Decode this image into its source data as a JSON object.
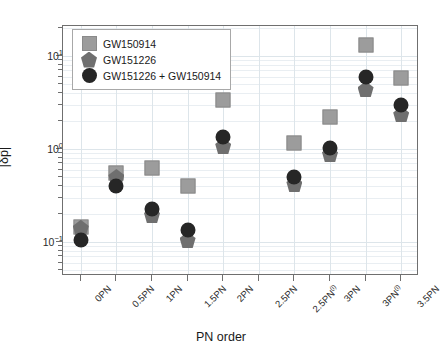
{
  "chart_data": {
    "type": "scatter",
    "title": "",
    "xlabel": "PN order",
    "ylabel": "|δp̂|",
    "yscale": "log",
    "ylim": [
      0.075,
      20
    ],
    "grid": true,
    "legend_position": "upper-left",
    "categories": [
      "0PN",
      "0.5PN",
      "1PN",
      "1.5PN",
      "2PN",
      "2.5PN",
      "2.5PN(l)",
      "3PN",
      "3PN(l)",
      "3.5PN"
    ],
    "category_labels_html": [
      "0PN",
      "0.5PN",
      "1PN",
      "1.5PN",
      "2PN",
      "2.5PN",
      "2.5PN<sup>(l)</sup>",
      "3PN",
      "3PN<sup>(l)</sup>",
      "3.5PN"
    ],
    "ytick_labels": [
      "10¹",
      "10⁰",
      "10⁻¹"
    ],
    "ytick_values": [
      10,
      1,
      0.1
    ],
    "series": [
      {
        "name": "GW150914",
        "marker": "square",
        "color": "#9c9c9c",
        "values": [
          0.145,
          0.55,
          0.63,
          0.4,
          3.4,
          null,
          1.15,
          2.2,
          13.0,
          5.8
        ]
      },
      {
        "name": "GW151226",
        "marker": "pentagon",
        "color": "#6f6f6f",
        "values": [
          0.142,
          0.5,
          0.195,
          0.105,
          1.08,
          null,
          0.42,
          0.88,
          4.4,
          2.35
        ]
      },
      {
        "name": "GW151226 + GW150914",
        "marker": "circle",
        "color": "#262626",
        "values": [
          0.105,
          0.4,
          0.225,
          0.135,
          1.35,
          null,
          0.5,
          1.02,
          5.9,
          3.0
        ]
      }
    ]
  },
  "legend": {
    "items": [
      {
        "label": "GW150914",
        "marker": "square"
      },
      {
        "label": "GW151226",
        "marker": "pentagon"
      },
      {
        "label": "GW151226 + GW150914",
        "marker": "circle"
      }
    ]
  }
}
